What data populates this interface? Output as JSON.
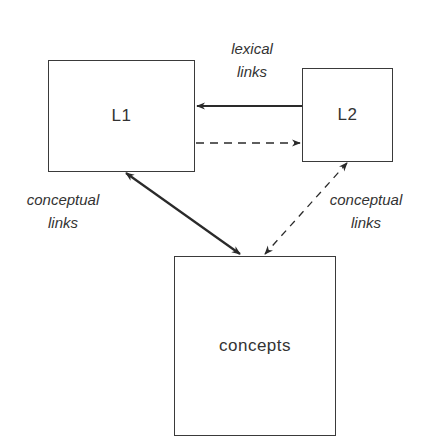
{
  "diagram": {
    "nodes": {
      "l1": {
        "label": "L1"
      },
      "l2": {
        "label": "L2"
      },
      "concepts": {
        "label": "concepts"
      }
    },
    "labels": {
      "lexical": {
        "line1": "lexical",
        "line2": "links"
      },
      "conceptual_left": {
        "line1": "conceptual",
        "line2": "links"
      },
      "conceptual_right": {
        "line1": "conceptual",
        "line2": "links"
      }
    },
    "edges": [
      {
        "from": "L2",
        "to": "L1",
        "style": "solid",
        "direction": "one-way",
        "group": "lexical links"
      },
      {
        "from": "L1",
        "to": "L2",
        "style": "dashed",
        "direction": "one-way",
        "group": "lexical links"
      },
      {
        "from": "L1",
        "to": "concepts",
        "style": "solid",
        "direction": "two-way",
        "group": "conceptual links"
      },
      {
        "from": "L2",
        "to": "concepts",
        "style": "dashed",
        "direction": "two-way",
        "group": "conceptual links"
      }
    ],
    "colors": {
      "stroke": "#2a2a2a",
      "background": "#ffffff"
    }
  }
}
